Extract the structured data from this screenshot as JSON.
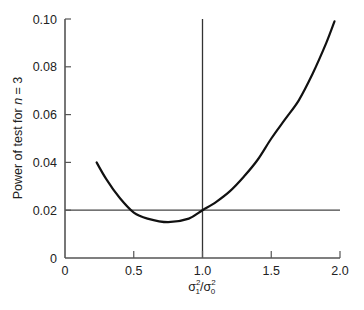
{
  "chart_data": {
    "type": "line",
    "title": "",
    "xlabel": "σ₁²/σ₀²",
    "xlabel_parts": {
      "sym1": "σ",
      "sup1": "2",
      "sub1": "1",
      "slash": "/",
      "sym2": "σ",
      "sup2": "2",
      "sub2": "0"
    },
    "ylabel": "Power of test for n = 3",
    "ylabel_parts": {
      "prefix": "Power of test for ",
      "var": "n",
      "suffix": " = 3"
    },
    "xlim": [
      0,
      2.0
    ],
    "ylim": [
      0,
      0.1
    ],
    "xticks": [
      0,
      0.5,
      1.0,
      1.5,
      2.0
    ],
    "xtick_labels": [
      "0",
      "0.5",
      "1.0",
      "1.5",
      "2.0"
    ],
    "yticks": [
      0,
      0.02,
      0.04,
      0.06,
      0.08,
      0.1
    ],
    "ytick_labels": [
      "0",
      "0.02",
      "0.04",
      "0.06",
      "0.08",
      "0.10"
    ],
    "grid": false,
    "legend": null,
    "reference_lines": [
      {
        "orientation": "horizontal",
        "y": 0.02
      },
      {
        "orientation": "vertical",
        "x": 1.0
      }
    ],
    "series": [
      {
        "name": "Power of test",
        "x": [
          0.23,
          0.3,
          0.4,
          0.5,
          0.6,
          0.75,
          0.9,
          1.0,
          1.1,
          1.2,
          1.3,
          1.4,
          1.5,
          1.6,
          1.7,
          1.8,
          1.9,
          1.96
        ],
        "y": [
          0.04,
          0.033,
          0.025,
          0.019,
          0.0165,
          0.015,
          0.0165,
          0.02,
          0.0235,
          0.028,
          0.034,
          0.041,
          0.05,
          0.058,
          0.066,
          0.077,
          0.09,
          0.099
        ]
      }
    ]
  }
}
